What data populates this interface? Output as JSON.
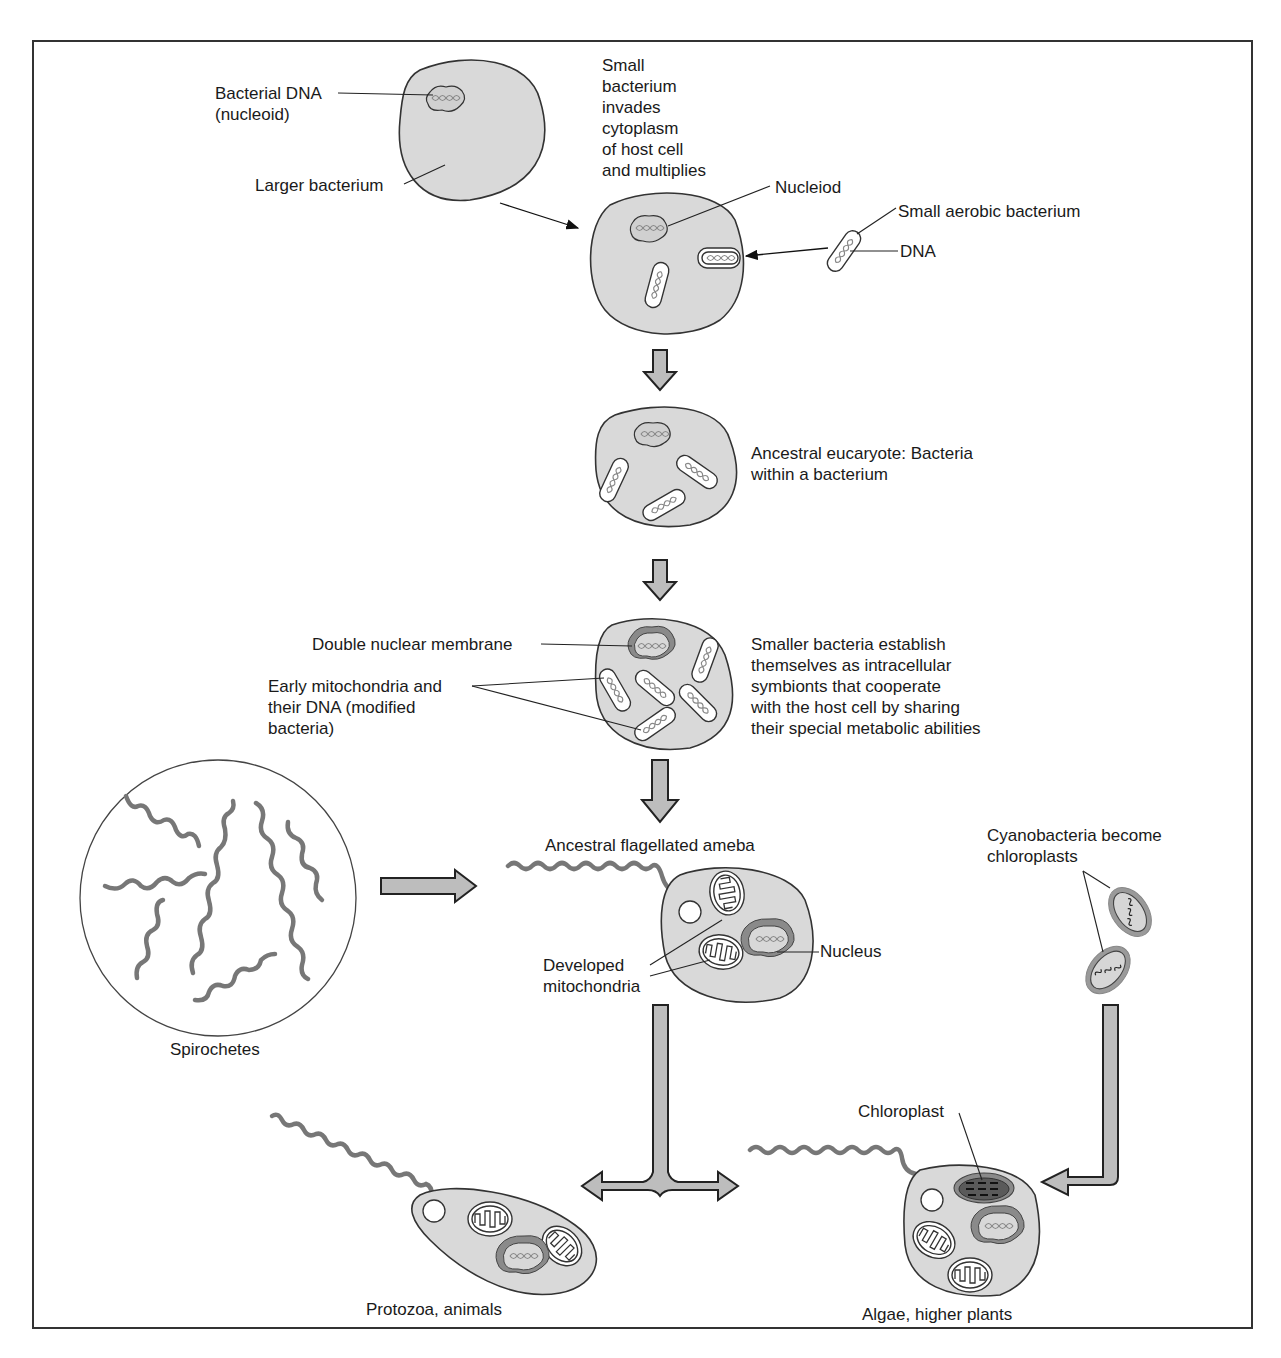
{
  "diagram": {
    "stages": [
      {
        "id": "larger-bacterium",
        "labels": [
          "Bacterial DNA\n(nucleoid)",
          "Larger bacterium"
        ]
      },
      {
        "id": "invasion",
        "labels": [
          "Small\nbacterium\ninvades\ncytoplasm\nof host cell\nand multiplies",
          "Nucleiod",
          "Small aerobic bacterium",
          "DNA"
        ]
      },
      {
        "id": "ancestral-eucaryote",
        "labels": [
          "Ancestral eucaryote: Bacteria\nwithin a bacterium"
        ]
      },
      {
        "id": "symbionts",
        "labels": [
          "Double nuclear membrane",
          "Early mitochondria and\ntheir DNA (modified\nbacteria)",
          "Smaller bacteria establish\nthemselves as intracellular\nsymbionts that cooperate\nwith the host cell by sharing\ntheir special metabolic abilities"
        ]
      },
      {
        "id": "spirochetes",
        "labels": [
          "Spirochetes"
        ]
      },
      {
        "id": "flagellated-ameba",
        "labels": [
          "Ancestral flagellated ameba",
          "Developed\nmitochondria",
          "Nucleus"
        ]
      },
      {
        "id": "cyanobacteria",
        "labels": [
          "Cyanobacteria become\nchloroplasts"
        ]
      },
      {
        "id": "protozoa",
        "labels": [
          "Protozoa, animals"
        ]
      },
      {
        "id": "algae",
        "labels": [
          "Algae, higher plants",
          "Chloroplast"
        ]
      }
    ]
  },
  "labels": {
    "bacterial_dna": "Bacterial DNA\n(nucleoid)",
    "larger_bacterium": "Larger bacterium",
    "small_bacterium_invades": "Small\nbacterium\ninvades\ncytoplasm\nof host cell\nand multiplies",
    "nucleiod": "Nucleiod",
    "small_aerobic_bacterium": "Small aerobic bacterium",
    "dna": "DNA",
    "ancestral_eucaryote": "Ancestral eucaryote: Bacteria\nwithin a bacterium",
    "double_nuclear_membrane": "Double nuclear membrane",
    "early_mitochondria": "Early mitochondria and\ntheir DNA (modified\nbacteria)",
    "smaller_bacteria": "Smaller bacteria establish\nthemselves as intracellular\nsymbionts that cooperate\nwith the host cell by sharing\ntheir special metabolic abilities",
    "ancestral_ameba": "Ancestral flagellated ameba",
    "cyanobacteria": "Cyanobacteria become\nchloroplasts",
    "developed_mitochondria": "Developed\nmitochondria",
    "nucleus": "Nucleus",
    "spirochetes": "Spirochetes",
    "chloroplast": "Chloroplast",
    "protozoa": "Protozoa, animals",
    "algae": "Algae, higher plants"
  },
  "colors": {
    "cell_fill": "#d9d9d9",
    "outline": "#333333",
    "arrow_fill": "#bdbdbd",
    "nuclear_membrane": "#8a8a8a"
  }
}
